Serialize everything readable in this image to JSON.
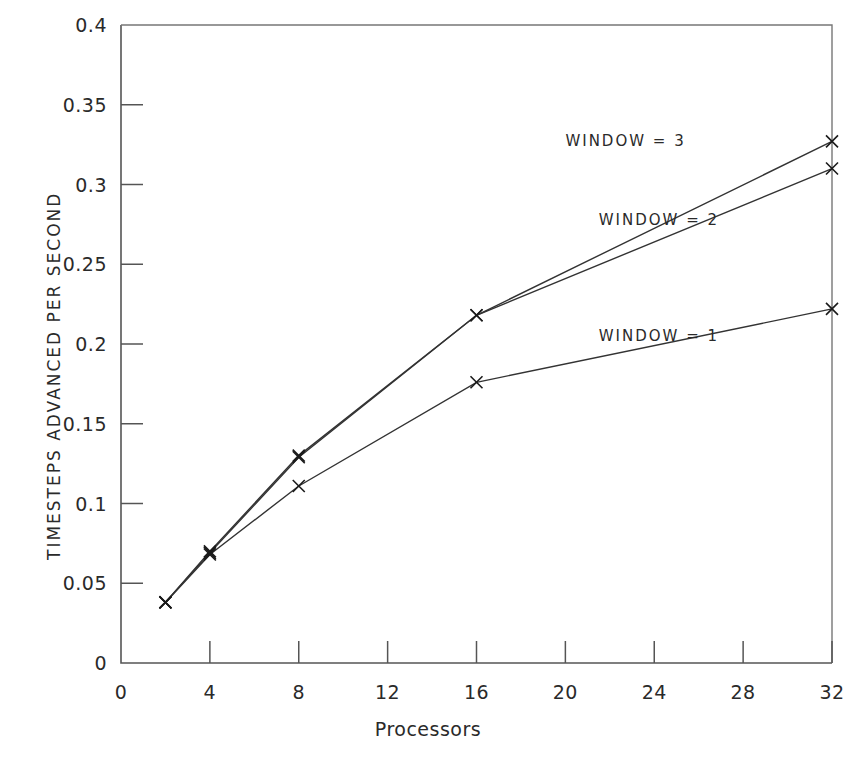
{
  "chart_data": {
    "type": "line",
    "title": "",
    "xlabel": "Processors",
    "ylabel": "TIMESTEPS ADVANCED PER SECOND",
    "x": [
      2,
      4,
      8,
      16,
      32
    ],
    "xlim": [
      0,
      32
    ],
    "ylim": [
      0,
      0.4
    ],
    "xticks": [
      "0",
      "4",
      "8",
      "12",
      "16",
      "20",
      "24",
      "28",
      "32"
    ],
    "xtick_values": [
      0,
      4,
      8,
      12,
      16,
      20,
      24,
      28,
      32
    ],
    "yticks": [
      "0",
      "0.05",
      "0.1",
      "0.15",
      "0.2",
      "0.25",
      "0.3",
      "0.35",
      "0.4"
    ],
    "ytick_values": [
      0,
      0.05,
      0.1,
      0.15,
      0.2,
      0.25,
      0.3,
      0.35,
      0.4
    ],
    "grid": false,
    "legend_position": "inline-annotations",
    "marker": "x",
    "series": [
      {
        "name": "WINDOW = 3",
        "values": [
          0.038,
          0.07,
          0.13,
          0.218,
          0.327
        ],
        "label_x": 20,
        "label_y": 0.3275
      },
      {
        "name": "WINDOW = 2",
        "values": [
          0.038,
          0.069,
          0.129,
          0.218,
          0.31
        ],
        "label_x": 21.5,
        "label_y": 0.2775
      },
      {
        "name": "WINDOW = 1",
        "values": [
          0.038,
          0.068,
          0.111,
          0.176,
          0.222
        ],
        "label_x": 21.5,
        "label_y": 0.205
      }
    ],
    "colors": {
      "axis": "#555555",
      "line": "#333333",
      "marker": "#1a1a1a",
      "text": "#2a2a2a",
      "background": "#ffffff"
    }
  },
  "axis": {
    "x_title": "Processors",
    "y_title": "TIMESTEPS ADVANCED PER SECOND"
  }
}
